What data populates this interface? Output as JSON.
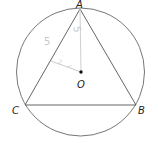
{
  "diagram": {
    "type": "geometry",
    "colors": {
      "lines": "#555555",
      "annotations": "#c8c8c8",
      "center_dot": "#111111",
      "background": "#ffffff"
    },
    "circle": {
      "center": "O",
      "cx": 80.5,
      "cy": 72,
      "r": 64
    },
    "points": {
      "A": {
        "label": "A",
        "x": 80,
        "y": 9
      },
      "B": {
        "label": "B",
        "x": 136,
        "y": 105
      },
      "C": {
        "label": "C",
        "x": 25,
        "y": 105
      },
      "O": {
        "label": "O",
        "x": 81,
        "y": 72
      }
    },
    "segments": [
      "AB",
      "BC",
      "CA",
      "AO",
      "OM"
    ],
    "annotations": {
      "side_label": "5",
      "radius_label": "5",
      "perp_mark_1": "2",
      "perp_mark_2": "✓"
    }
  }
}
